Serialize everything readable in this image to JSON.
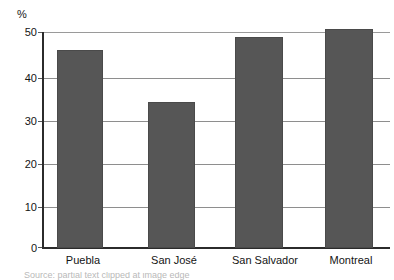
{
  "chart_data": {
    "type": "bar",
    "title": "",
    "subtitle": "",
    "xlabel": "",
    "ylabel": "%",
    "unit_label": "%",
    "categories": [
      "Puebla",
      "San José",
      "San Salvador",
      "Montreal"
    ],
    "values": [
      46,
      34,
      49,
      51
    ],
    "series": [
      {
        "name": "",
        "values": [
          46,
          34,
          49,
          51
        ]
      }
    ],
    "ylim": [
      0,
      50
    ],
    "ytick_labels": [
      "0",
      "10",
      "20",
      "30",
      "40",
      "50"
    ],
    "ytick_values": [
      0,
      10,
      20,
      30,
      40,
      50
    ],
    "grid": true,
    "grid_orientation": "horizontal",
    "legend": false,
    "legend_position": "none",
    "annotations": [],
    "colors": {
      "bar_fill": "#565656",
      "bar_border": "#4a4a4a",
      "gridline": "#8e8e8e",
      "axis": "#2b2b2b",
      "text": "#141414",
      "background": "#ffffff"
    }
  },
  "figure": {
    "unit_label": "%",
    "caption_partial": "Source: partial text clipped at image edge"
  },
  "axis": {
    "ticks": [
      {
        "label": "50",
        "value": 50
      },
      {
        "label": "40",
        "value": 40
      },
      {
        "label": "30",
        "value": 30
      },
      {
        "label": "20",
        "value": 20
      },
      {
        "label": "10",
        "value": 10
      },
      {
        "label": "0",
        "value": 0
      }
    ]
  },
  "bars": [
    {
      "label": "Puebla",
      "value": 46
    },
    {
      "label": "San José",
      "value": 34
    },
    {
      "label": "San Salvador",
      "value": 49
    },
    {
      "label": "Montreal",
      "value": 51
    }
  ]
}
